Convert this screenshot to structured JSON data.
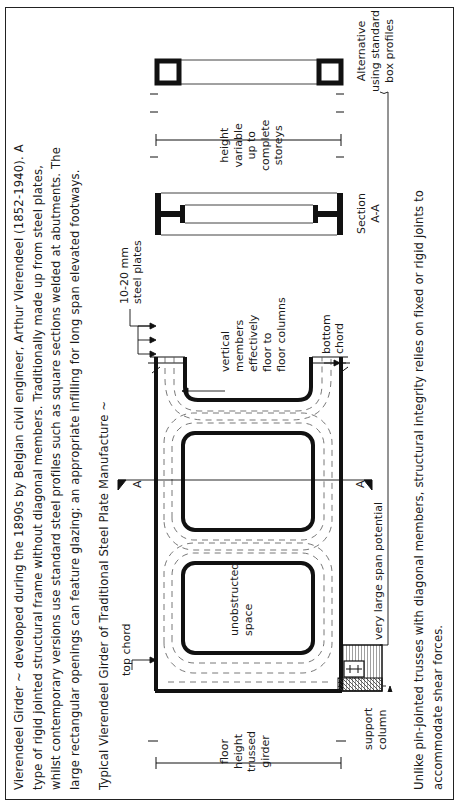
{
  "intro": {
    "lines": [
      "Vierendeel Girder ~ developed during the 1890s by Belgian civil engineer, Arthur Vierendeel (1852-1940). A",
      "type of rigid jointed structural frame without diagonal members. Traditionally made up from steel plates,",
      "whilst contemporary versions use standard steel profiles such as square sections welded at abutments. The",
      "large rectangular openings can feature glazing; an appropriate infilling for long span elevated footways."
    ]
  },
  "figure": {
    "title": "Typical Vierendeel Girder of Traditional Steel Plate Manufacture ~",
    "labels": {
      "top_chord": "top chord",
      "unobstructed_space": [
        "unobstructed",
        "space"
      ],
      "very_large_span": "very large span potential",
      "support_column": [
        "support",
        "column"
      ],
      "floor_height": [
        "floor",
        "height",
        "trussed",
        "girder"
      ],
      "vertical_members": [
        "vertical",
        "members",
        "effectively",
        "floor to",
        "floor columns"
      ],
      "steel_plates": [
        "10-20 mm",
        "steel plates"
      ],
      "bottom_chord": [
        "bottom",
        "chord"
      ],
      "section_marker": "A",
      "section_aa": [
        "Section",
        "A-A"
      ],
      "height_variable": [
        "height",
        "variable",
        "up to",
        "complete",
        "storeys"
      ],
      "alternative": [
        "Alternative",
        "using standard",
        "box profiles"
      ]
    }
  },
  "footer": {
    "lines": [
      "Unlike pin-jointed trusses with diagonal members, structural integrity relies on fixed or rigid joints to",
      "accommodate shear forces."
    ]
  }
}
